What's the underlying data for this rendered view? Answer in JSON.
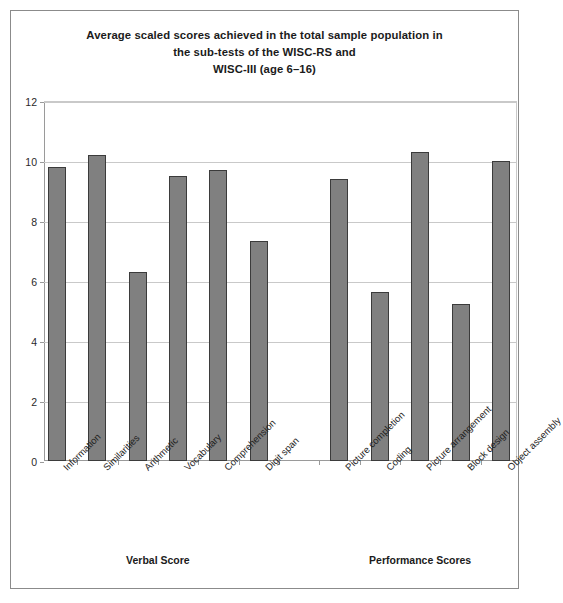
{
  "chart_data": {
    "type": "bar",
    "title": "Average scaled scores achieved in the total sample population in the sub-tests of the WISC-RS and WISC-III (age 6–16)",
    "title_lines": [
      "Average scaled scores achieved in the total sample population in",
      "the sub-tests of the WISC-RS and",
      "WISC-III (age 6–16)"
    ],
    "categories": [
      "Information",
      "Similarities",
      "Arithmetic",
      "Vocabulary",
      "Comprehension",
      "Digit span",
      "Picture completion",
      "Coding",
      "Picture arrangement",
      "Block design",
      "Object assembly"
    ],
    "values": [
      9.8,
      10.2,
      6.3,
      9.5,
      9.7,
      7.35,
      9.4,
      5.65,
      10.3,
      5.25,
      10.0
    ],
    "xlabel": "",
    "ylabel": "",
    "ylim": [
      0,
      12
    ],
    "ytick_labels": [
      "0",
      "2",
      "4",
      "6",
      "8",
      "10",
      "12"
    ],
    "ytick_values": [
      0,
      2,
      4,
      6,
      8,
      10,
      12
    ],
    "grid": true,
    "legend": "none",
    "groups": [
      {
        "label": "Verbal Score",
        "categories": [
          "Information",
          "Similarities",
          "Arithmetic",
          "Vocabulary",
          "Comprehension",
          "Digit span"
        ]
      },
      {
        "label": "Performance Scores",
        "categories": [
          "Picture completion",
          "Coding",
          "Picture arrangement",
          "Block design",
          "Object assembly"
        ]
      }
    ],
    "bar_color": "#808080",
    "bar_border_color": "#3b3b3b",
    "grid_color": "#c9c9c9",
    "axis_color": "#9a9a9a",
    "frame_color": "#8b8b8b"
  }
}
